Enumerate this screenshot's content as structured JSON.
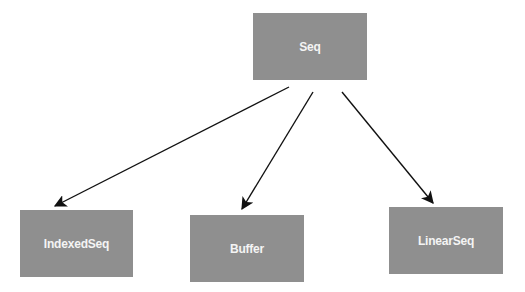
{
  "diagram": {
    "type": "hierarchy",
    "colors": {
      "node_fill": "#8f8f8f",
      "node_text": "#f4f4f4",
      "edge": "#111111",
      "background": "#ffffff"
    },
    "nodes": [
      {
        "id": "seq",
        "label": "Seq",
        "x": 253,
        "y": 13,
        "w": 114,
        "h": 67
      },
      {
        "id": "indexedseq",
        "label": "IndexedSeq",
        "x": 20,
        "y": 210,
        "w": 113,
        "h": 67
      },
      {
        "id": "buffer",
        "label": "Buffer",
        "x": 190,
        "y": 215,
        "w": 114,
        "h": 67
      },
      {
        "id": "linearseq",
        "label": "LinearSeq",
        "x": 389,
        "y": 207,
        "w": 114,
        "h": 67
      }
    ],
    "edges": [
      {
        "from": "seq",
        "to": "indexedseq"
      },
      {
        "from": "seq",
        "to": "buffer"
      },
      {
        "from": "seq",
        "to": "linearseq"
      }
    ]
  }
}
